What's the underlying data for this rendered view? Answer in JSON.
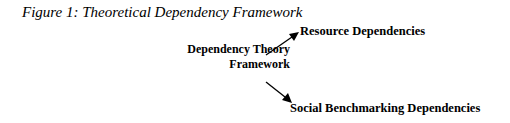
{
  "figure": {
    "caption": "Figure 1: Theoretical Dependency Framework",
    "center_node": {
      "line1": "Dependency Theory",
      "line2": "Framework"
    },
    "branches": [
      {
        "label": "Resource Dependencies"
      },
      {
        "label": "Social Benchmarking Dependencies"
      }
    ]
  }
}
